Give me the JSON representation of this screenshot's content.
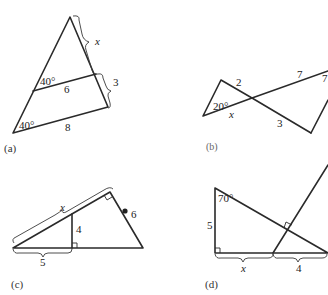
{
  "figures": {
    "a": {
      "caption": "(a)",
      "labels": {
        "top_side": "x",
        "upper_angle": "40°",
        "middle_segment": "6",
        "lower_side": "3",
        "bottom_angle": "40°",
        "base": "8"
      }
    },
    "b": {
      "caption": "(b)",
      "labels": {
        "left_top_side": "2",
        "right_top_side": "7",
        "right_angle_marker": "7",
        "angle": "20°",
        "left_bottom_side": "x",
        "right_bottom_side": "3"
      }
    },
    "c": {
      "caption": "(c)",
      "labels": {
        "hypotenuse": "x",
        "altitude": "4",
        "right_side": "6",
        "base_part": "5"
      }
    },
    "d": {
      "caption": "(d)",
      "labels": {
        "angle": "70°",
        "left_side": "5",
        "base_left": "x",
        "base_right": "4"
      }
    }
  }
}
